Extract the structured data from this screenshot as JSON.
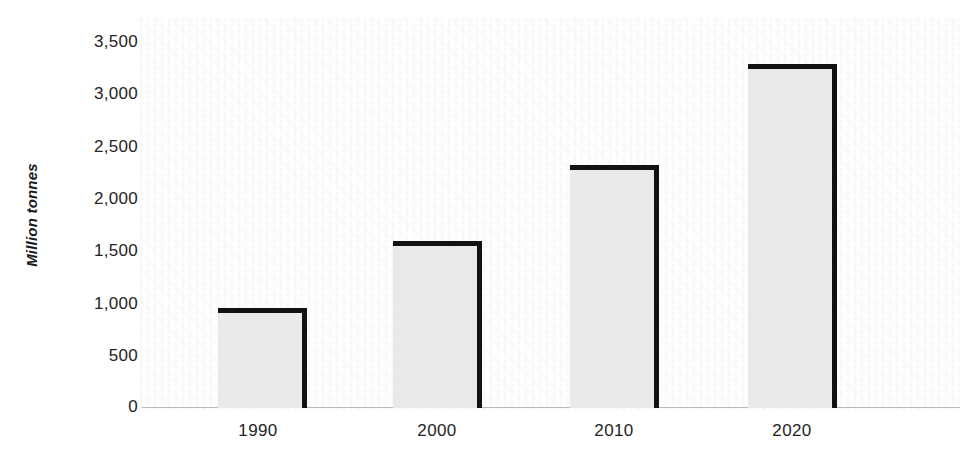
{
  "chart_data": {
    "type": "bar",
    "title": "",
    "subtitle": "",
    "xlabel": "",
    "ylabel": "Million tonnes",
    "categories": [
      "1990",
      "2000",
      "2010",
      "2020"
    ],
    "values": [
      950,
      1590,
      2320,
      3290
    ],
    "ylim": [
      0,
      3500
    ],
    "xlim": [
      null,
      null
    ],
    "y_ticks": [
      0,
      500,
      1000,
      1500,
      2000,
      2500,
      3000,
      3500
    ],
    "y_tick_labels": [
      "0",
      "500",
      "1,000",
      "1,500",
      "2,000",
      "2,500",
      "3,000",
      "3,500"
    ],
    "x_tick_labels": [
      "1990",
      "2000",
      "2010",
      "2020"
    ],
    "grid": false,
    "legend": null,
    "legend_position": "none",
    "annotations": [],
    "series": [
      {
        "name": "Million tonnes",
        "values": [
          950,
          1590,
          2320,
          3290
        ]
      }
    ],
    "colors": {
      "bar_fill": "#e9e9e9",
      "bar_outline": "#121212",
      "axis_line": "#b9b9b9",
      "tick_label": "#242424",
      "axis_title": "#1a1a1a",
      "background": "#ffffff"
    }
  },
  "axis": {
    "y_title": "Million tonnes",
    "ticks_y": [
      {
        "label": "3,500",
        "value": 3500
      },
      {
        "label": "3,000",
        "value": 3000
      },
      {
        "label": "2,500",
        "value": 2500
      },
      {
        "label": "2,000",
        "value": 2000
      },
      {
        "label": "1,500",
        "value": 1500
      },
      {
        "label": "1,000",
        "value": 1000
      },
      {
        "label": "500",
        "value": 500
      },
      {
        "label": "0",
        "value": 0
      }
    ],
    "ticks_x": [
      {
        "label": "1990"
      },
      {
        "label": "2000"
      },
      {
        "label": "2010"
      },
      {
        "label": "2020"
      }
    ]
  }
}
